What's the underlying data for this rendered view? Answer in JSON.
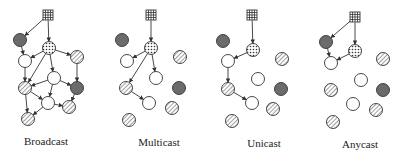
{
  "colors": {
    "stroke": "#333333",
    "dark": "#6b6b6b",
    "white": "#ffffff",
    "hatch": "#777777",
    "dot": "#333333"
  },
  "panels": [
    {
      "label": "Broadcast",
      "label_pos": [
        46,
        135
      ],
      "nodes": {
        "src": {
          "x": 48,
          "y": 15,
          "type": "source"
        },
        "d1": {
          "x": 20,
          "y": 40,
          "type": "dark"
        },
        "dot": {
          "x": 49,
          "y": 48,
          "type": "dotted"
        },
        "h1": {
          "x": 77,
          "y": 57,
          "type": "hatched"
        },
        "w1": {
          "x": 25,
          "y": 61,
          "type": "white"
        },
        "w2": {
          "x": 54,
          "y": 78,
          "type": "white"
        },
        "h2": {
          "x": 25,
          "y": 88,
          "type": "hatched"
        },
        "d2": {
          "x": 77,
          "y": 88,
          "type": "dark"
        },
        "w3": {
          "x": 48,
          "y": 103,
          "type": "white"
        },
        "h3": {
          "x": 69,
          "y": 107,
          "type": "hatched"
        },
        "h4": {
          "x": 28,
          "y": 119,
          "type": "hatched"
        }
      },
      "edges": [
        [
          "src",
          "d1"
        ],
        [
          "src",
          "dot"
        ],
        [
          "d1",
          "w1"
        ],
        [
          "dot",
          "w1"
        ],
        [
          "dot",
          "h2"
        ],
        [
          "dot",
          "w2"
        ],
        [
          "dot",
          "h1"
        ],
        [
          "h1",
          "d2"
        ],
        [
          "w1",
          "h2"
        ],
        [
          "w2",
          "h2"
        ],
        [
          "w2",
          "d2"
        ],
        [
          "w2",
          "w3"
        ],
        [
          "h2",
          "w3"
        ],
        [
          "h2",
          "h4"
        ],
        [
          "w3",
          "h4"
        ],
        [
          "w3",
          "h3"
        ],
        [
          "d2",
          "h3"
        ]
      ]
    },
    {
      "label": "Multicast",
      "label_pos": [
        159,
        136
      ],
      "nodes": {
        "src": {
          "x": 151,
          "y": 15,
          "type": "source"
        },
        "d1": {
          "x": 122,
          "y": 40,
          "type": "dark"
        },
        "dot": {
          "x": 151,
          "y": 48,
          "type": "dotted"
        },
        "h1": {
          "x": 180,
          "y": 57,
          "type": "hatched"
        },
        "w1": {
          "x": 127,
          "y": 61,
          "type": "white"
        },
        "w2": {
          "x": 156,
          "y": 78,
          "type": "white"
        },
        "h2": {
          "x": 126,
          "y": 88,
          "type": "hatched"
        },
        "d2": {
          "x": 179,
          "y": 88,
          "type": "dark"
        },
        "w3": {
          "x": 149,
          "y": 103,
          "type": "white"
        },
        "h3": {
          "x": 172,
          "y": 108,
          "type": "hatched"
        },
        "h4": {
          "x": 129,
          "y": 120,
          "type": "hatched"
        }
      },
      "edges": [
        [
          "src",
          "dot"
        ],
        [
          "dot",
          "w1"
        ],
        [
          "dot",
          "w2"
        ],
        [
          "dot",
          "h2"
        ],
        [
          "h2",
          "w3"
        ]
      ]
    },
    {
      "label": "Unicast",
      "label_pos": [
        264,
        137
      ],
      "nodes": {
        "src": {
          "x": 252,
          "y": 15,
          "type": "source"
        },
        "d1": {
          "x": 223,
          "y": 41,
          "type": "dark"
        },
        "dot": {
          "x": 253,
          "y": 50,
          "type": "dotted"
        },
        "h1": {
          "x": 282,
          "y": 59,
          "type": "hatched"
        },
        "w1": {
          "x": 228,
          "y": 61,
          "type": "white"
        },
        "w2": {
          "x": 258,
          "y": 79,
          "type": "white"
        },
        "h2": {
          "x": 228,
          "y": 89,
          "type": "hatched"
        },
        "d2": {
          "x": 281,
          "y": 89,
          "type": "dark"
        },
        "w3": {
          "x": 252,
          "y": 103,
          "type": "white"
        },
        "h3": {
          "x": 273,
          "y": 109,
          "type": "hatched"
        },
        "h4": {
          "x": 232,
          "y": 121,
          "type": "hatched"
        }
      },
      "edges": [
        [
          "src",
          "dot"
        ],
        [
          "dot",
          "w1"
        ],
        [
          "w1",
          "h2"
        ],
        [
          "h2",
          "w3"
        ]
      ]
    },
    {
      "label": "Anycast",
      "label_pos": [
        360,
        138
      ],
      "nodes": {
        "src": {
          "x": 355,
          "y": 17,
          "type": "source"
        },
        "d1": {
          "x": 326,
          "y": 42,
          "type": "dark"
        },
        "dot": {
          "x": 355,
          "y": 51,
          "type": "dotted"
        },
        "h1": {
          "x": 383,
          "y": 59,
          "type": "hatched"
        },
        "w1": {
          "x": 331,
          "y": 63,
          "type": "white"
        },
        "w2": {
          "x": 361,
          "y": 80,
          "type": "white"
        },
        "h2": {
          "x": 331,
          "y": 90,
          "type": "hatched"
        },
        "d2": {
          "x": 383,
          "y": 90,
          "type": "dark"
        },
        "w3": {
          "x": 353,
          "y": 104,
          "type": "white"
        },
        "h3": {
          "x": 376,
          "y": 110,
          "type": "hatched"
        },
        "h4": {
          "x": 333,
          "y": 122,
          "type": "hatched"
        }
      },
      "edges": [
        [
          "src",
          "d1"
        ],
        [
          "src",
          "dot"
        ],
        [
          "d1",
          "w1"
        ],
        [
          "dot",
          "w1"
        ]
      ]
    }
  ]
}
